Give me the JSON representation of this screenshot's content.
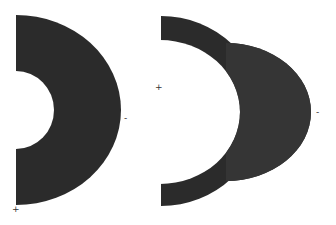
{
  "figure": {
    "fill_color": "#2b2b2b",
    "background": "#ffffff",
    "left_shape": {
      "label": "annular half-ring",
      "plus_marker": "+",
      "minus_marker": "-"
    },
    "right_shape": {
      "label": "half-ring minus overlapping disk",
      "plus_marker": "+",
      "minus_marker": "-"
    }
  }
}
